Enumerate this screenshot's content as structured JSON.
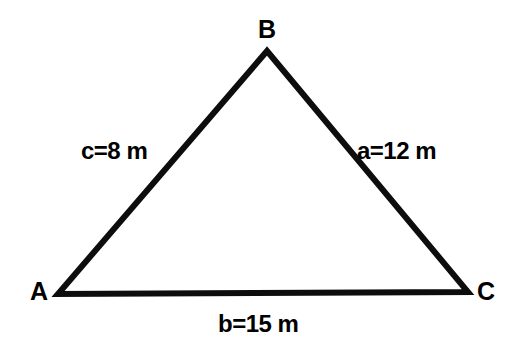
{
  "figure": {
    "type": "geometry-diagram",
    "shape": "triangle",
    "background_color": "#ffffff",
    "stroke_color": "#0d0d0d",
    "text_color": "#000000",
    "vertices": [
      {
        "name": "B",
        "label": "B",
        "x": 267,
        "y": 51
      },
      {
        "name": "A",
        "label": "A",
        "x": 58,
        "y": 294
      },
      {
        "name": "C",
        "label": "C",
        "x": 468,
        "y": 292
      }
    ],
    "sides": [
      {
        "name": "side-c",
        "label": "c=8 m",
        "variable": "c",
        "value": 8,
        "unit": "m",
        "between": "A-B"
      },
      {
        "name": "side-a",
        "label": "a=12 m",
        "variable": "a",
        "value": 12,
        "unit": "m",
        "between": "B-C"
      },
      {
        "name": "side-b",
        "label": "b=15 m",
        "variable": "b",
        "value": 15,
        "unit": "m",
        "between": "A-C"
      }
    ]
  }
}
